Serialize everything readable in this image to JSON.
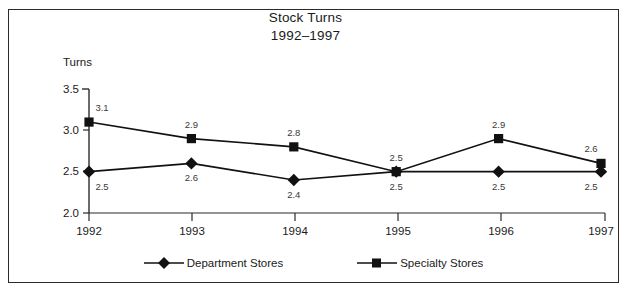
{
  "chart_data": {
    "type": "line",
    "title": "Stock Turns",
    "subtitle": "1992–1997",
    "xlabel": "",
    "ylabel": "Turns",
    "categories": [
      "1992",
      "1993",
      "1994",
      "1995",
      "1996",
      "1997"
    ],
    "ylim": [
      2.0,
      3.5
    ],
    "yticks": [
      "2.0",
      "2.5",
      "3.0",
      "3.5"
    ],
    "ytick_values": [
      2.0,
      2.5,
      3.0,
      3.5
    ],
    "grid": false,
    "legend_position": "bottom",
    "series": [
      {
        "name": "Department Stores",
        "marker": "diamond",
        "color": "#111111",
        "label_position": "below",
        "values": [
          2.5,
          2.6,
          2.4,
          2.5,
          2.5,
          2.5
        ],
        "labels": [
          "2.5",
          "2.6",
          "2.4",
          "2.5",
          "2.5",
          "2.5"
        ]
      },
      {
        "name": "Specialty Stores",
        "marker": "square",
        "color": "#111111",
        "label_position": "above",
        "values": [
          3.1,
          2.9,
          2.8,
          2.5,
          2.9,
          2.6
        ],
        "labels": [
          "3.1",
          "2.9",
          "2.8",
          "2.5",
          "2.9",
          "2.6"
        ]
      }
    ]
  },
  "figure": {
    "title_line1": "Stock Turns",
    "title_line2": "1992–1997",
    "y_axis_title": "Turns",
    "border_color": "#2b2b2b",
    "background": "#ffffff",
    "ink_color": "#111111"
  },
  "legend": {
    "items": [
      {
        "label": "Department Stores",
        "marker": "diamond-marker"
      },
      {
        "label": "Specialty Stores",
        "marker": "square-marker"
      }
    ]
  },
  "axes": {
    "y_ticks": [
      "3.5",
      "3.0",
      "2.5",
      "2.0"
    ],
    "x_ticks": [
      "1992",
      "1993",
      "1994",
      "1995",
      "1996",
      "1997"
    ]
  }
}
